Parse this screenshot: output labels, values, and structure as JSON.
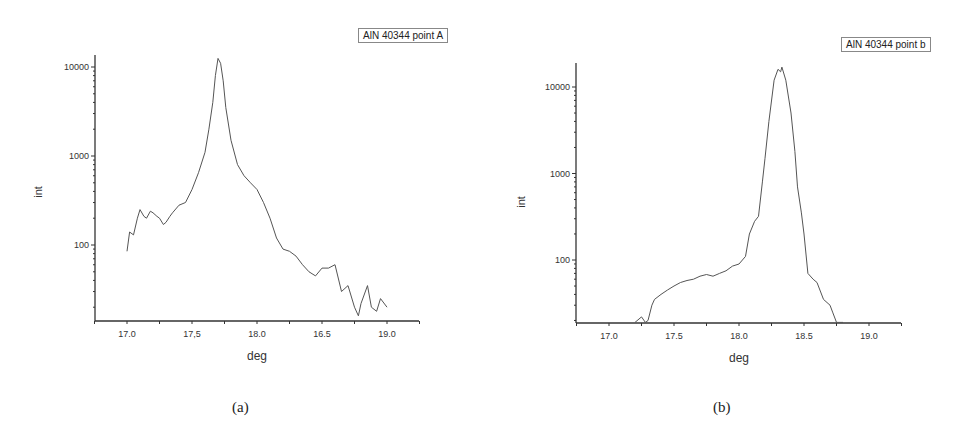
{
  "chart_data": [
    {
      "type": "line",
      "title": "",
      "legend": [
        "AlN 40344 point A"
      ],
      "legend_position": "top-right",
      "xlabel": "deg",
      "ylabel": "int",
      "yscale": "log",
      "xlim": [
        16.75,
        19.25
      ],
      "ylim": [
        14,
        13500
      ],
      "grid": false,
      "xticks": [
        17.0,
        17.5,
        18.0,
        18.5,
        19.0
      ],
      "xtick_labels": [
        "17.0",
        "17,5",
        "18.0",
        "16.5",
        "19.0"
      ],
      "yticks": [
        100,
        1000,
        10000
      ],
      "ytick_labels": [
        "100",
        "1000",
        "10000"
      ],
      "caption": "(a)",
      "series": [
        {
          "name": "AlN 40344 point A",
          "x": [
            17.0,
            17.02,
            17.05,
            17.08,
            17.1,
            17.13,
            17.15,
            17.18,
            17.2,
            17.23,
            17.25,
            17.28,
            17.3,
            17.33,
            17.35,
            17.4,
            17.45,
            17.5,
            17.55,
            17.6,
            17.63,
            17.66,
            17.68,
            17.7,
            17.72,
            17.74,
            17.76,
            17.8,
            17.85,
            17.9,
            17.95,
            18.0,
            18.05,
            18.1,
            18.15,
            18.2,
            18.25,
            18.3,
            18.35,
            18.4,
            18.45,
            18.5,
            18.55,
            18.6,
            18.65,
            18.7,
            18.75,
            18.78,
            18.8,
            18.85,
            18.88,
            18.92,
            18.95,
            19.0
          ],
          "values": [
            85,
            140,
            130,
            200,
            250,
            210,
            200,
            240,
            230,
            210,
            200,
            170,
            180,
            210,
            230,
            280,
            300,
            420,
            650,
            1100,
            2000,
            4000,
            8000,
            12500,
            11000,
            7000,
            3500,
            1500,
            800,
            600,
            500,
            420,
            300,
            200,
            120,
            90,
            85,
            75,
            60,
            50,
            45,
            55,
            55,
            60,
            30,
            35,
            20,
            16,
            22,
            35,
            20,
            18,
            25,
            20
          ]
        }
      ]
    },
    {
      "type": "line",
      "title": "",
      "legend": [
        "AlN 40344 point b"
      ],
      "legend_position": "top-right",
      "xlabel": "deg",
      "ylabel": "int",
      "yscale": "log",
      "xlim": [
        16.75,
        19.25
      ],
      "ylim": [
        19,
        19000
      ],
      "grid": false,
      "xticks": [
        17.0,
        17.5,
        18.0,
        18.5,
        19.0
      ],
      "xtick_labels": [
        "17.0",
        "17.5",
        "18.0",
        "18.5",
        "19.0"
      ],
      "yticks": [
        100,
        1000,
        10000
      ],
      "ytick_labels": [
        "100",
        "1000",
        "10000"
      ],
      "caption": "(b)",
      "series": [
        {
          "name": "AlN 40344 point b",
          "x": [
            17.2,
            17.25,
            17.28,
            17.3,
            17.33,
            17.35,
            17.4,
            17.45,
            17.5,
            17.55,
            17.6,
            17.65,
            17.7,
            17.75,
            17.8,
            17.85,
            17.9,
            17.95,
            18.0,
            18.05,
            18.08,
            18.12,
            18.15,
            18.18,
            18.2,
            18.23,
            18.27,
            18.3,
            18.32,
            18.33,
            18.36,
            18.4,
            18.43,
            18.45,
            18.48,
            18.5,
            18.53,
            18.57,
            18.6,
            18.65,
            18.7,
            18.72,
            18.75,
            18.8
          ],
          "values": [
            19,
            22,
            19,
            20,
            30,
            35,
            40,
            45,
            50,
            55,
            58,
            60,
            65,
            68,
            65,
            70,
            75,
            85,
            90,
            110,
            200,
            280,
            320,
            800,
            1500,
            4000,
            12000,
            16000,
            15000,
            17000,
            12000,
            5000,
            1800,
            700,
            350,
            200,
            70,
            60,
            55,
            35,
            30,
            25,
            19,
            19
          ]
        }
      ]
    }
  ],
  "panels": {
    "a": {
      "legend": "AlN 40344 point A",
      "ylabel": "int",
      "xlabel": "deg",
      "caption": "(a)"
    },
    "b": {
      "legend": "AlN 40344 point b",
      "ylabel": "int",
      "xlabel": "deg",
      "caption": "(b)"
    }
  },
  "colors": {
    "line": "#555555",
    "axis": "#333333",
    "background": "#ffffff"
  }
}
